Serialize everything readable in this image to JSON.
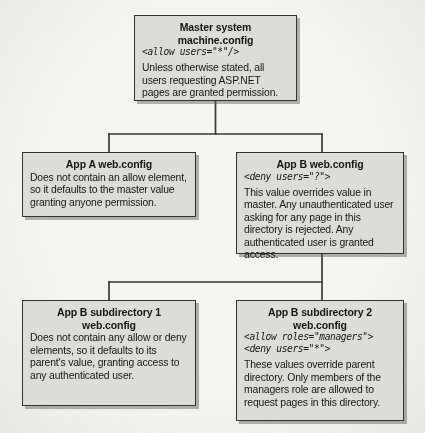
{
  "diagram": {
    "type": "tree",
    "background_color": "#f6f5f1",
    "node_fill_color": "#dedcd7",
    "node_border_color": "#33322f",
    "connector_color": "#3a3935",
    "nodes": [
      {
        "id": "master",
        "title": "Master system machine.config",
        "code": "<allow users=\"*\"/>",
        "body": "Unless otherwise stated, all users requesting ASP.NET pages are granted permission."
      },
      {
        "id": "app-a",
        "title": "App A web.config",
        "code": "",
        "body": "Does not contain an allow element, so it defaults to the master value granting anyone permission."
      },
      {
        "id": "app-b",
        "title": "App B web.config",
        "code": "<deny users=\"?\">",
        "body": "This value overrides value in master. Any unauthenticated user asking for any page in this directory is rejected. Any authenticated user is granted access."
      },
      {
        "id": "app-b-sub1",
        "title": "App B subdirectory 1",
        "title_line2": "web.config",
        "code": "",
        "body": "Does not contain any allow or deny elements, so it defaults to its parent's value, granting access to any authenticated user."
      },
      {
        "id": "app-b-sub2",
        "title": "App B subdirectory 2",
        "title_line2": "web.config",
        "code": "<allow roles=\"managers\">\n<deny users=\"*\">",
        "body": "These values override parent directory. Only members of the managers role are allowed to request pages in this directory."
      }
    ],
    "edges": [
      {
        "from": "master",
        "to": "app-a"
      },
      {
        "from": "master",
        "to": "app-b"
      },
      {
        "from": "app-b",
        "to": "app-b-sub1"
      },
      {
        "from": "app-b",
        "to": "app-b-sub2"
      }
    ]
  }
}
